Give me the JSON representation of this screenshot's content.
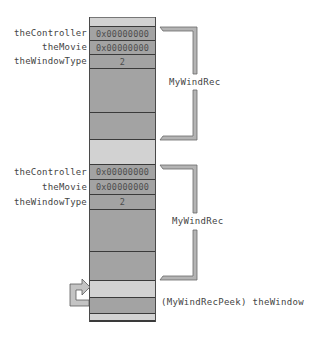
{
  "diagram": {
    "records": [
      {
        "fields": [
          {
            "name": "theController",
            "value": "0x00000000"
          },
          {
            "name": "theMovie",
            "value": "0x00000000"
          },
          {
            "name": "theWindowType",
            "value": "2"
          }
        ],
        "bracket_label": "MyWindRec"
      },
      {
        "fields": [
          {
            "name": "theController",
            "value": "0x00000000"
          },
          {
            "name": "theMovie",
            "value": "0x00000000"
          },
          {
            "name": "theWindowType",
            "value": "2"
          }
        ],
        "bracket_label": "MyWindRec"
      }
    ],
    "pointer_label": "(MyWindRecPeek) theWindow",
    "colors": {
      "field_fill": "#a3a3a3",
      "gap_fill": "#d2d2d2",
      "bracket": "#9a9a9a",
      "text": "#444444"
    }
  }
}
